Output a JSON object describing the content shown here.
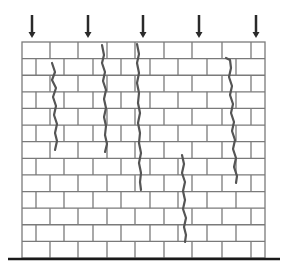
{
  "figure": {
    "width": 292,
    "height": 271,
    "colors": {
      "background": "#ffffff",
      "mortar_line": "#7a7a7a",
      "crack": "#555555",
      "arrow": "#2a2a2a",
      "ground": "#1a1a1a"
    },
    "wall": {
      "left": 22,
      "right": 265,
      "top": 42,
      "bottom": 258,
      "rows": 13,
      "odd_row_joints": [
        50,
        78,
        107,
        135,
        164,
        192,
        222,
        251
      ],
      "even_row_joints": [
        36,
        64,
        93,
        121,
        150,
        178,
        207,
        236
      ]
    },
    "load_arrows": [
      {
        "x": 32,
        "y1": 15,
        "y2": 38
      },
      {
        "x": 88,
        "y1": 15,
        "y2": 38
      },
      {
        "x": 143,
        "y1": 15,
        "y2": 38
      },
      {
        "x": 199,
        "y1": 15,
        "y2": 38
      },
      {
        "x": 256,
        "y1": 15,
        "y2": 38
      }
    ],
    "cracks": [
      {
        "points": "52,63 55,72 52,80 56,88 53,97 56,106 54,115 57,124 55,133 57,141 55,150"
      },
      {
        "points": "102,45 104,55 102,63 105,72 103,81 106,90 104,99 106,108 104,117 106,126 105,135 107,144 105,152"
      },
      {
        "points": "137,44 139,54 137,63 139,73 137,83 139,93 138,103 140,113 138,123 140,133 139,143 141,153 139,163 141,173 140,182 141,190"
      },
      {
        "points": "182,155 184,164 182,173 185,182 183,191 185,200 183,209 186,218 184,227 186,235 185,242"
      },
      {
        "points": "226,58 230,60 231,68 229,77 232,86 230,95 233,104 231,113 234,122 232,131 235,140 233,149 236,158 234,167 237,176 236,183"
      }
    ],
    "ground_line": {
      "x1": 8,
      "x2": 280,
      "y": 259
    }
  }
}
